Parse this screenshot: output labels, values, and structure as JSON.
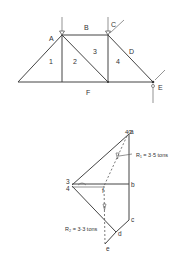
{
  "figure": {
    "page_number_fragment": "40",
    "truss": {
      "region_labels": {
        "A": "A",
        "B": "B",
        "C": "C",
        "D": "D",
        "E": "E",
        "F": "F",
        "p1": "1",
        "p2": "2",
        "p3": "3",
        "p4": "4"
      }
    },
    "force_diagram": {
      "point_labels": {
        "a": "a",
        "b": "b",
        "c": "c",
        "d": "d",
        "e": "e",
        "f": "f",
        "p3": "3",
        "p4": "4"
      },
      "reactions": {
        "r1": "R₁ = 3·5 tons",
        "r2": "R₂ = 3·3 tons"
      }
    }
  }
}
